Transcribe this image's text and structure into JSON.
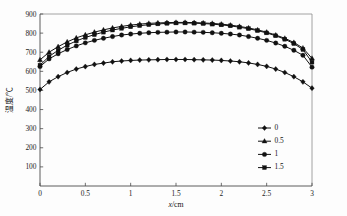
{
  "figure": {
    "background_color": "#fdfdfd",
    "ink_color": "#111111"
  },
  "chart_data": {
    "type": "line",
    "title": "",
    "subtitle": "",
    "xlabel": "x/cm",
    "ylabel": "温度/℃",
    "xlim": [
      0,
      3
    ],
    "ylim": [
      0,
      900
    ],
    "grid": false,
    "legend_position": "lower-right",
    "legend_title": "",
    "xticks": [
      0,
      0.5,
      1,
      1.5,
      2,
      2.5,
      3
    ],
    "xtick_labels": [
      "0",
      "0.5",
      "1",
      "1.5",
      "2",
      "2.5",
      "3"
    ],
    "yticks": [
      100,
      200,
      300,
      400,
      500,
      600,
      700,
      800,
      900
    ],
    "ytick_labels": [
      "100",
      "200",
      "300",
      "400",
      "500",
      "600",
      "700",
      "800",
      "900"
    ],
    "x": [
      0,
      0.1,
      0.2,
      0.3,
      0.4,
      0.5,
      0.6,
      0.7,
      0.8,
      0.9,
      1.0,
      1.1,
      1.2,
      1.3,
      1.4,
      1.5,
      1.6,
      1.7,
      1.8,
      1.9,
      2.0,
      2.1,
      2.2,
      2.3,
      2.4,
      2.5,
      2.6,
      2.7,
      2.8,
      2.9,
      3.0
    ],
    "series": [
      {
        "name": "0",
        "marker": "diamond",
        "values": [
          505,
          545,
          572,
          594,
          612,
          625,
          636,
          643,
          650,
          654,
          657,
          659,
          660,
          661,
          662,
          662,
          662,
          661,
          660,
          659,
          657,
          654,
          650,
          644,
          636,
          626,
          612,
          594,
          572,
          545,
          512
        ]
      },
      {
        "name": "0.5",
        "marker": "triangle",
        "values": [
          660,
          700,
          729,
          754,
          775,
          791,
          805,
          817,
          827,
          835,
          842,
          847,
          851,
          853,
          855,
          856,
          856,
          855,
          853,
          851,
          847,
          842,
          835,
          827,
          817,
          805,
          790,
          773,
          751,
          722,
          668
        ]
      },
      {
        "name": "1",
        "marker": "circle",
        "values": [
          625,
          665,
          692,
          714,
          733,
          749,
          762,
          773,
          782,
          790,
          795,
          799,
          802,
          804,
          805,
          806,
          806,
          805,
          804,
          802,
          799,
          795,
          790,
          782,
          773,
          762,
          748,
          731,
          710,
          684,
          622
        ]
      },
      {
        "name": "1.5",
        "marker": "square",
        "values": [
          632,
          678,
          710,
          737,
          759,
          777,
          792,
          805,
          816,
          825,
          833,
          839,
          844,
          848,
          851,
          853,
          853,
          852,
          850,
          847,
          843,
          838,
          831,
          823,
          813,
          801,
          786,
          768,
          745,
          714,
          648
        ]
      }
    ]
  },
  "legend": {
    "items": [
      {
        "label": "0",
        "marker": "diamond"
      },
      {
        "label": "0.5",
        "marker": "triangle"
      },
      {
        "label": "1",
        "marker": "circle"
      },
      {
        "label": "1.5",
        "marker": "square"
      }
    ]
  }
}
